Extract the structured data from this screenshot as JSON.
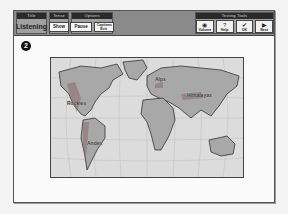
{
  "header": {
    "groups": [
      {
        "title": "Title",
        "value": "Listening"
      },
      {
        "title": "Tense",
        "buttons": [
          "Show"
        ]
      },
      {
        "title": "Options",
        "buttons": [
          "Pause",
          "Captions Exit"
        ]
      },
      {
        "title": "Testing Tools",
        "tools": [
          {
            "label": "Volume",
            "icon": "speaker-icon",
            "glyph": "◉"
          },
          {
            "label": "Help",
            "icon": "question-icon",
            "glyph": "?"
          },
          {
            "label": "OK",
            "icon": "checkmark-icon",
            "glyph": "✔"
          },
          {
            "label": "Next",
            "icon": "arrow-right-icon",
            "glyph": "▶"
          }
        ]
      }
    ]
  },
  "step": {
    "number": "2"
  },
  "map": {
    "labels": [
      {
        "name": "Rockies",
        "x": 18,
        "y": 42
      },
      {
        "name": "Alps",
        "x": 102,
        "y": 20
      },
      {
        "name": "Himalayas",
        "x": 138,
        "y": 36
      },
      {
        "name": "Andes",
        "x": 40,
        "y": 85
      }
    ],
    "colors": {
      "ocean": "#dcdcdc",
      "land": "#a8a8a8",
      "mountain": "#8c6a6a",
      "grid": "#c4c4c4"
    }
  }
}
